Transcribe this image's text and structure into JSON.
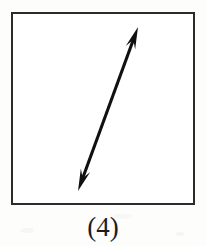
{
  "figure": {
    "caption": "(4)",
    "box": {
      "x": 11,
      "y": 12,
      "width": 184,
      "height": 193,
      "border_color": "#2b2b2b",
      "border_width": 2,
      "fill_color": "#ffffff"
    },
    "arrow": {
      "kind": "double-headed-arrow",
      "color": "#101010",
      "stroke_width": 3,
      "start_x": 78,
      "start_y": 191,
      "end_x": 138,
      "end_y": 27,
      "head_length": 22,
      "head_half_width": 5,
      "direction_label": "diagonal up-right / down-left"
    }
  },
  "page": {
    "background_color": "#fdfdfc",
    "width": 206,
    "height": 246
  }
}
